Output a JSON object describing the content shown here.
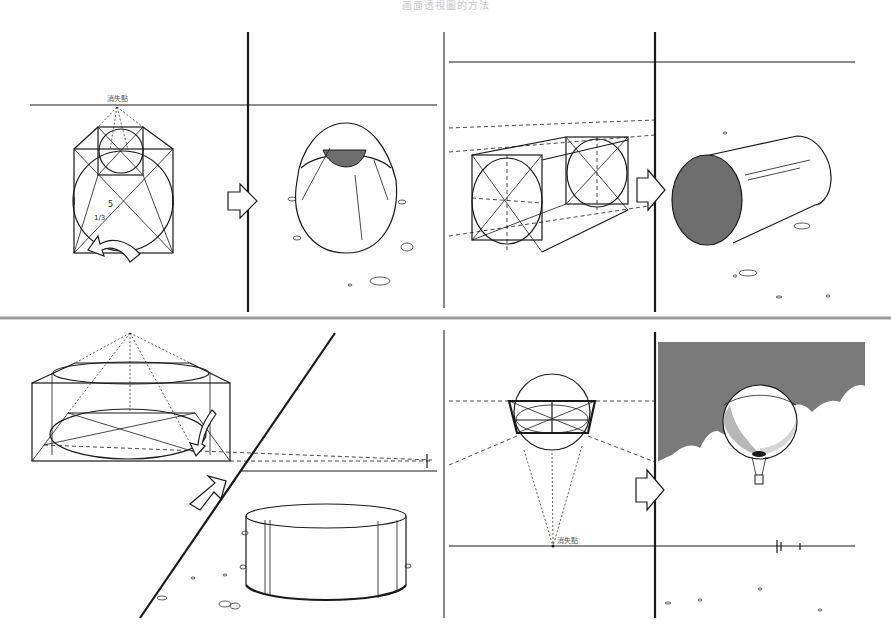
{
  "header": {
    "title": "画面透視圖的方法"
  },
  "panels": [
    {
      "id": "top-left",
      "label": "消失點",
      "description": "Cylinder viewed end-on from above: box construction with inscribed circles converging to a vanishing point, then rendered cylinder with shaded top"
    },
    {
      "id": "top-right",
      "description": "Horizontal cylinder constructed in two-point perspective boxes, rendered as cylinder with shaded end face"
    },
    {
      "id": "bottom-left",
      "description": "Short wide cylinder constructed in perspective box, rendered as open drum on ground"
    },
    {
      "id": "bottom-right",
      "label": "消失點",
      "description": "Sphere viewed from below with vanishing point, rendered as hot-air balloon above clouds"
    }
  ],
  "colors": {
    "ink": "#1a1a1a",
    "shade": "#6e6e6e",
    "sky": "#7a7a7a",
    "divider": "#9a9a9a",
    "background": "#ffffff"
  }
}
